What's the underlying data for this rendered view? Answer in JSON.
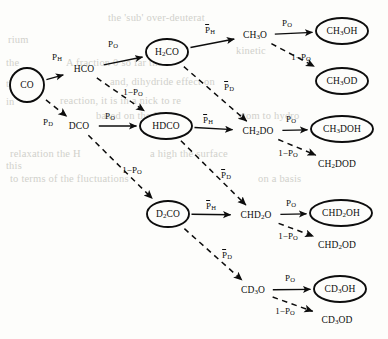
{
  "figure": {
    "type": "reaction-network-diagram",
    "colors": {
      "ink": "#0d0d0d",
      "paper": "#fdfdfb",
      "bleed_text": "#b9b9b2"
    }
  },
  "nodes": [
    {
      "id": "CO",
      "label": "CO",
      "shape": "circle",
      "x": 27,
      "y": 85
    },
    {
      "id": "HCO",
      "label": "HCO",
      "shape": "none",
      "x": 84,
      "y": 69
    },
    {
      "id": "DCO",
      "label": "DCO",
      "shape": "none",
      "x": 79,
      "y": 126
    },
    {
      "id": "H2CO",
      "label": "H2CO",
      "shape": "ellipse",
      "x": 167,
      "y": 52
    },
    {
      "id": "HDCO",
      "label": "HDCO",
      "shape": "ellipse",
      "x": 166,
      "y": 126
    },
    {
      "id": "D2CO",
      "label": "D2CO",
      "shape": "ellipse",
      "x": 168,
      "y": 214
    },
    {
      "id": "CH3O",
      "label": "CH3O",
      "shape": "none",
      "x": 255,
      "y": 35
    },
    {
      "id": "CH2DO",
      "label": "CH2DO",
      "shape": "none",
      "x": 258,
      "y": 131
    },
    {
      "id": "CHD2O",
      "label": "CHD2O",
      "shape": "none",
      "x": 256,
      "y": 215
    },
    {
      "id": "CD3O",
      "label": "CD3O",
      "shape": "none",
      "x": 253,
      "y": 290
    },
    {
      "id": "CH3OH",
      "label": "CH3OH",
      "shape": "ellipse",
      "x": 342,
      "y": 31
    },
    {
      "id": "CH3OD",
      "label": "CH3OD",
      "shape": "ellipse",
      "x": 342,
      "y": 81
    },
    {
      "id": "CH3DOH",
      "label": "CH3DOH",
      "shape": "ellipse",
      "x": 342,
      "y": 129
    },
    {
      "id": "CH2DOD",
      "label": "CH2DOD",
      "shape": "none",
      "x": 337,
      "y": 164
    },
    {
      "id": "CHD2OH",
      "label": "CHD2OH",
      "shape": "ellipse",
      "x": 341,
      "y": 213
    },
    {
      "id": "CHD2OD",
      "label": "CHD2OD",
      "shape": "none",
      "x": 337,
      "y": 245
    },
    {
      "id": "CD3OH",
      "label": "CD3OH",
      "shape": "ellipse",
      "x": 340,
      "y": 289
    },
    {
      "id": "CD3OD",
      "label": "CD3OD",
      "shape": "none",
      "x": 337,
      "y": 320
    }
  ],
  "edges": [
    {
      "from": "CO",
      "to": "HCO",
      "style": "solid",
      "label": "PH",
      "lx": 57,
      "ly": 57
    },
    {
      "from": "CO",
      "to": "DCO",
      "style": "dashed",
      "label": "PD",
      "lx": 48,
      "ly": 122
    },
    {
      "from": "HCO",
      "to": "H2CO",
      "style": "solid",
      "label": "PO",
      "lx": 113,
      "ly": 44
    },
    {
      "from": "HCO",
      "to": "HDCO",
      "style": "dashed",
      "label": "1-PO",
      "lx": 133,
      "ly": 92
    },
    {
      "from": "DCO",
      "to": "HDCO",
      "style": "solid",
      "label": "PO",
      "lx": 110,
      "ly": 116
    },
    {
      "from": "DCO",
      "to": "D2CO",
      "style": "dashed",
      "label": "1-PO",
      "lx": 132,
      "ly": 170
    },
    {
      "from": "H2CO",
      "to": "CH3O",
      "style": "solid",
      "label": "PHbar",
      "lx": 210,
      "ly": 30
    },
    {
      "from": "H2CO",
      "to": "CH2DO",
      "style": "dashed",
      "label": "PDbar",
      "lx": 229,
      "ly": 87
    },
    {
      "from": "HDCO",
      "to": "CH2DO",
      "style": "solid",
      "label": "PHbar",
      "lx": 208,
      "ly": 120
    },
    {
      "from": "HDCO",
      "to": "CHD2O",
      "style": "dashed",
      "label": "PDbar",
      "lx": 226,
      "ly": 175
    },
    {
      "from": "D2CO",
      "to": "CHD2O",
      "style": "solid",
      "label": "PHbar",
      "lx": 211,
      "ly": 206
    },
    {
      "from": "D2CO",
      "to": "CD3O",
      "style": "dashed",
      "label": "PDbar",
      "lx": 227,
      "ly": 255
    },
    {
      "from": "CH3O",
      "to": "CH3OH",
      "style": "solid",
      "label": "PO",
      "lx": 287,
      "ly": 23
    },
    {
      "from": "CH3O",
      "to": "CH3OD",
      "style": "dashed",
      "label": "1-PO",
      "lx": 301,
      "ly": 57
    },
    {
      "from": "CH2DO",
      "to": "CH3DOH",
      "style": "solid",
      "label": "PO",
      "lx": 291,
      "ly": 119
    },
    {
      "from": "CH2DO",
      "to": "CH2DOD",
      "style": "dashed",
      "label": "1-PO",
      "lx": 288,
      "ly": 153
    },
    {
      "from": "CHD2O",
      "to": "CHD2OH",
      "style": "solid",
      "label": "PO",
      "lx": 291,
      "ly": 203
    },
    {
      "from": "CHD2O",
      "to": "CHD2OD",
      "style": "dashed",
      "label": "1-PO",
      "lx": 288,
      "ly": 236
    },
    {
      "from": "CD3O",
      "to": "CD3OH",
      "style": "solid",
      "label": "PO",
      "lx": 290,
      "ly": 278
    },
    {
      "from": "CD3O",
      "to": "CD3OD",
      "style": "dashed",
      "label": "1-PO",
      "lx": 285,
      "ly": 311
    }
  ],
  "bleed_text": [
    {
      "t": "the 'sub' over-deuterat",
      "x": 108,
      "y": 12
    },
    {
      "t": "rium",
      "x": 8,
      "y": 34
    },
    {
      "t": "kinetic",
      "x": 236,
      "y": 45
    },
    {
      "t": "A fraction 0 so far the",
      "x": 66,
      "y": 57
    },
    {
      "t": "the",
      "x": 6,
      "y": 57
    },
    {
      "t": "and, dihydride effect on",
      "x": 110,
      "y": 76
    },
    {
      "t": "the",
      "x": 6,
      "y": 78
    },
    {
      "t": "reaction, it is in a nick to re",
      "x": 60,
      "y": 95
    },
    {
      "t": "in",
      "x": 6,
      "y": 96
    },
    {
      "t": "based on the H",
      "x": 96,
      "y": 110
    },
    {
      "t": "atom to hydro",
      "x": 238,
      "y": 110
    },
    {
      "t": "relaxation the H",
      "x": 10,
      "y": 148
    },
    {
      "t": "a high the surface",
      "x": 150,
      "y": 148
    },
    {
      "t": "this",
      "x": 6,
      "y": 160
    },
    {
      "t": "to terms of the fluctuations",
      "x": 10,
      "y": 173
    },
    {
      "t": "on a basis",
      "x": 258,
      "y": 173
    }
  ]
}
